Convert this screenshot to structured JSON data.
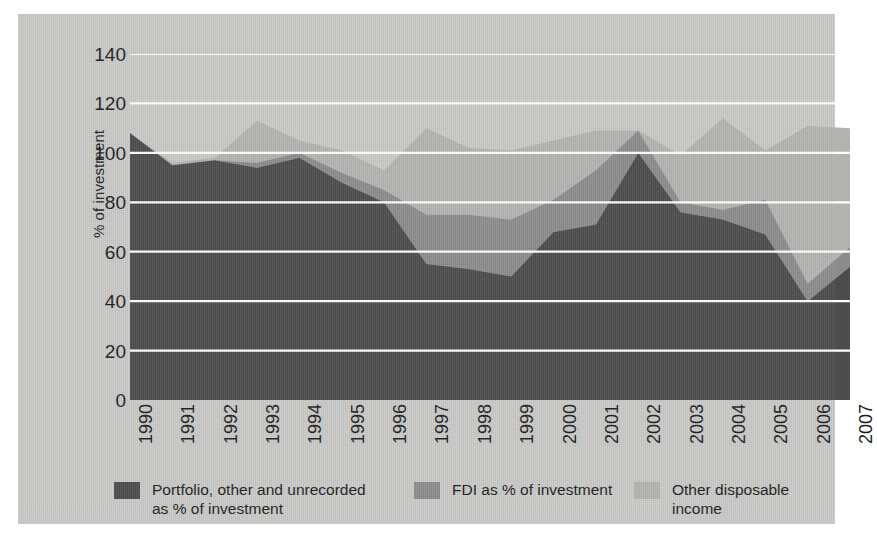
{
  "chart_data": {
    "type": "area",
    "stacked": true,
    "title": "",
    "xlabel": "",
    "ylabel": "% of investment",
    "ylim": [
      0,
      140
    ],
    "yticks": [
      0,
      20,
      40,
      60,
      80,
      100,
      120,
      140
    ],
    "grid": "horizontal-white-gridlines",
    "legend_position": "bottom",
    "categories": [
      "1990",
      "1991",
      "1992",
      "1993",
      "1994",
      "1995",
      "1996",
      "1997",
      "1998",
      "1999",
      "2000",
      "2001",
      "2002",
      "2003",
      "2004",
      "2005",
      "2006",
      "2007"
    ],
    "series": [
      {
        "name": "Portfolio, other and unrecorded\nas % of investment",
        "color": "#4c4c4c",
        "values": [
          108,
          95,
          97,
          94,
          98,
          88,
          80,
          55,
          53,
          50,
          68,
          71,
          100,
          76,
          73,
          67,
          40,
          54
        ]
      },
      {
        "name": "FDI as % of investment",
        "color": "#8c8c8c",
        "values": [
          0,
          0,
          0,
          2,
          2,
          4,
          5,
          20,
          22,
          23,
          13,
          22,
          9,
          4,
          4,
          14,
          7,
          8
        ]
      },
      {
        "name": "Other disposable income",
        "color": "#b3b3b1",
        "values": [
          0,
          1,
          1,
          17,
          5,
          9,
          8,
          35,
          27,
          28,
          24,
          16,
          0,
          19,
          37,
          20,
          64,
          48
        ]
      }
    ],
    "totals": [
      108,
      96,
      98,
      113,
      105,
      101,
      93,
      110,
      102,
      101,
      105,
      109,
      109,
      99,
      114,
      101,
      111,
      110
    ]
  },
  "legend": {
    "items": [
      {
        "label": "Portfolio, other and unrecorded\nas % of investment",
        "color": "#4c4c4c"
      },
      {
        "label": "FDI as % of investment",
        "color": "#8c8c8c"
      },
      {
        "label": "Other disposable income",
        "color": "#b3b3b1"
      }
    ]
  },
  "colors": {
    "panel_background": "#c9c9c7",
    "page_background": "#ffffff",
    "gridline": "#ffffff",
    "axis_text": "#1d1d1d",
    "series_dark": "#4c4c4c",
    "series_mid": "#8c8c8c",
    "series_light": "#b3b3b1"
  }
}
